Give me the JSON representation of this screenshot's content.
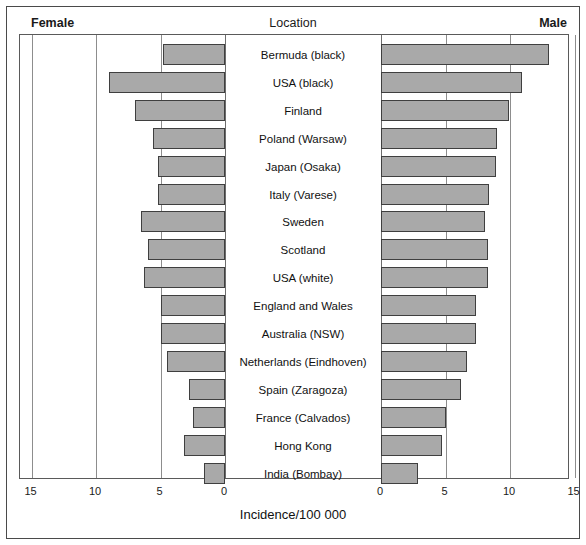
{
  "header": {
    "left_label": "Female",
    "center_label": "Location",
    "right_label": "Male"
  },
  "axis": {
    "xlabel": "Incidence/100 000",
    "left_ticks": [
      "15",
      "10",
      "5",
      "0"
    ],
    "right_ticks": [
      "0",
      "5",
      "10",
      "15"
    ]
  },
  "style": {
    "bar_fill": "#a9a9a9",
    "bar_stroke": "#3f3f3f",
    "grid_color": "#8d8d8d",
    "frame_color": "#5a5a5a"
  },
  "chart_data": {
    "type": "bar",
    "title": "",
    "subtitle": "",
    "orientation": "horizontal",
    "layout": "bidirectional-population-pyramid",
    "xlabel": "Incidence/100 000",
    "ylabel": "Location",
    "grid": true,
    "legend_position": "top",
    "left_axis": {
      "name": "Female",
      "ticks": [
        15,
        10,
        5,
        0
      ],
      "xlim": [
        15,
        0
      ],
      "direction": "right-to-left"
    },
    "right_axis": {
      "name": "Male",
      "ticks": [
        0,
        5,
        10,
        15
      ],
      "xlim": [
        0,
        15
      ],
      "direction": "left-to-right"
    },
    "categories": [
      "Bermuda (black)",
      "USA (black)",
      "Finland",
      "Poland (Warsaw)",
      "Japan (Osaka)",
      "Italy (Varese)",
      "Sweden",
      "Scotland",
      "USA (white)",
      "England and Wales",
      "Australia (NSW)",
      "Netherlands (Eindhoven)",
      "Spain (Zaragoza)",
      "France (Calvados)",
      "Hong Kong",
      "India (Bombay)"
    ],
    "series": [
      {
        "name": "Female",
        "side": "left",
        "values": [
          4.8,
          9.0,
          7.0,
          5.6,
          5.2,
          5.2,
          6.5,
          6.0,
          6.3,
          5.0,
          5.0,
          4.5,
          2.8,
          2.5,
          3.2,
          1.6
        ]
      },
      {
        "name": "Male",
        "side": "right",
        "values": [
          13.0,
          10.9,
          9.9,
          9.0,
          8.9,
          8.4,
          8.1,
          8.3,
          8.3,
          7.4,
          7.4,
          6.7,
          6.2,
          5.0,
          4.7,
          2.9
        ]
      }
    ]
  }
}
